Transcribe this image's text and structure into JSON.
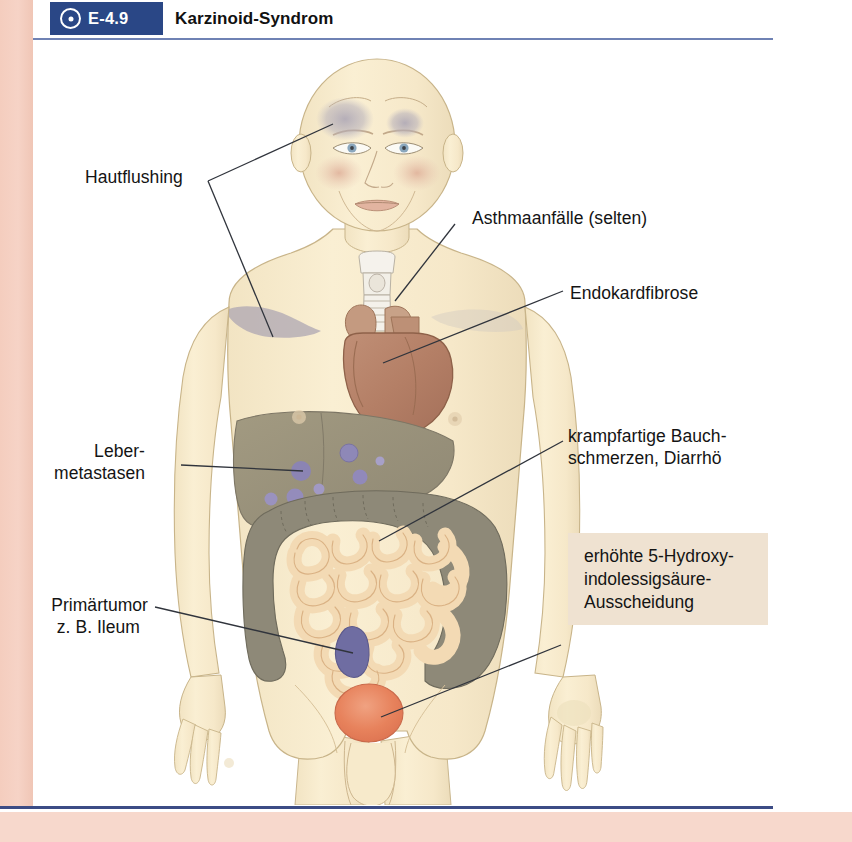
{
  "header": {
    "badge_icon": "target-dot-icon",
    "badge_label": "E-4.9",
    "title": "Karzinoid-Syndrom",
    "badge_bg": "#2a4786",
    "rule_color": "#6f82b4"
  },
  "figure": {
    "alt": "Anatomische Darstellung des Karzinoid-Syndroms",
    "organs": [
      {
        "name": "larynx-trachea",
        "color": "#f3f0ea"
      },
      {
        "name": "heart",
        "color": "#b5806a"
      },
      {
        "name": "liver",
        "color": "#9a9179"
      },
      {
        "name": "liver-metastases",
        "color": "#8e88b5"
      },
      {
        "name": "colon",
        "color": "#8c8777"
      },
      {
        "name": "small-intestine",
        "color": "#f2d9b2"
      },
      {
        "name": "ileum-tumor",
        "color": "#6f6da0"
      },
      {
        "name": "bladder",
        "color": "#e8825c"
      },
      {
        "name": "skin-flush-patch",
        "color": "#b0aab8"
      },
      {
        "name": "cheek-flush",
        "color": "#e2b9a6"
      },
      {
        "name": "body-skin",
        "color": "#f7e9c9"
      }
    ]
  },
  "labels": {
    "flushing": "Hautflushing",
    "asthma": "Asthmaanfälle (selten)",
    "endocardial": "Endokardfibrose",
    "abdominal_line1": "krampfartige Bauch-",
    "abdominal_line2": "schmerzen, Diarrhö",
    "liver_line1": "Leber-",
    "liver_line2": "metastasen",
    "tumor_line1": "Primärtumor",
    "tumor_line2": "z. B. Ileum"
  },
  "callout": {
    "line1": "erhöhte 5-Hydroxy-",
    "line2": "indolessigsäure-",
    "line3": "Ausscheidung",
    "bg": "#efe2d1"
  }
}
